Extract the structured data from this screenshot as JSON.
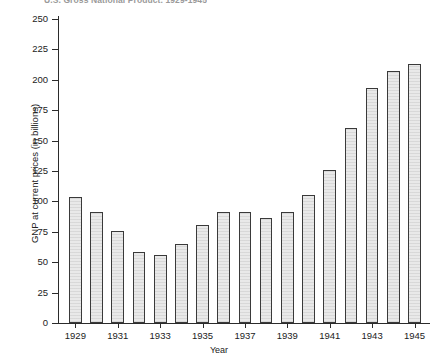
{
  "chart_data": {
    "type": "bar",
    "title": "U.S. Gross National Product, 1929-1945",
    "xlabel": "Year",
    "ylabel": "GNP at current prices (in billions)",
    "categories": [
      "1929",
      "1930",
      "1931",
      "1932",
      "1933",
      "1934",
      "1935",
      "1936",
      "1937",
      "1938",
      "1939",
      "1940",
      "1941",
      "1942",
      "1943",
      "1944",
      "1945"
    ],
    "values": [
      104,
      91,
      76,
      58,
      56,
      65,
      81,
      91,
      91,
      86,
      91,
      105,
      126,
      160,
      193,
      207,
      213
    ],
    "visible_x_tick_labels": [
      "1929",
      "1931",
      "1933",
      "1935",
      "1937",
      "1939",
      "1941",
      "1943",
      "1945"
    ],
    "y_tick_labels": [
      "0",
      "25",
      "50",
      "75",
      "100",
      "125",
      "150",
      "175",
      "200",
      "225",
      "250"
    ],
    "y_ticks": [
      0,
      25,
      50,
      75,
      100,
      125,
      150,
      175,
      200,
      225,
      250
    ],
    "ylim": [
      0,
      250
    ],
    "grid": false,
    "legend": false,
    "bar_fill_color": "#e9e9e9",
    "bar_edge_color": "#3a3a3a",
    "axis_color": "#2b2b2b",
    "background_color": "#ffffff"
  }
}
